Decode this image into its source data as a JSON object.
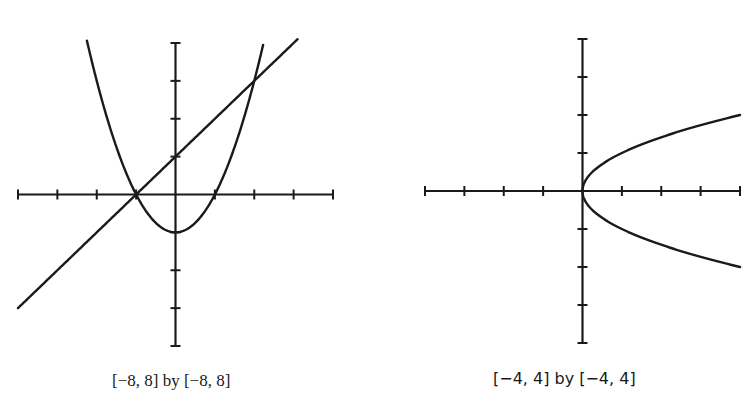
{
  "chart_data": [
    {
      "type": "line",
      "title": "",
      "caption": "[−8, 8] by [−8, 8]",
      "xlim": [
        -8,
        8
      ],
      "ylim": [
        -8,
        8
      ],
      "xlabel": "",
      "ylabel": "",
      "tick_spacing": 2,
      "grid": false,
      "legend": "none",
      "series": [
        {
          "name": "y = x^2/2 - 2 (parabola)",
          "x": [
            -5.3,
            -4,
            -2,
            0,
            2,
            4,
            4.4
          ],
          "y": [
            12,
            6,
            0,
            -2,
            0,
            6,
            7.7
          ]
        },
        {
          "name": "y = x + 2 (line)",
          "x": [
            -8,
            -2,
            0,
            4,
            6.2
          ],
          "y": [
            -6,
            0,
            2,
            6,
            8.2
          ]
        }
      ],
      "intersections": [
        [
          -2,
          0
        ],
        [
          4,
          6
        ]
      ]
    },
    {
      "type": "line",
      "title": "",
      "caption": "[−4, 4] by [−4, 4]",
      "xlim": [
        -4,
        4
      ],
      "ylim": [
        -4,
        4
      ],
      "xlabel": "",
      "ylabel": "",
      "tick_spacing": 1,
      "grid": false,
      "legend": "none",
      "series": [
        {
          "name": "x = y^2 (upper branch)",
          "x": [
            0,
            0.25,
            1,
            2,
            3,
            4
          ],
          "y": [
            0,
            0.5,
            1,
            1.41,
            1.73,
            2
          ]
        },
        {
          "name": "x = y^2 (lower branch)",
          "x": [
            0,
            0.25,
            1,
            2,
            3,
            4
          ],
          "y": [
            0,
            -0.5,
            -1,
            -1.41,
            -1.73,
            -2
          ]
        }
      ]
    }
  ],
  "captions": {
    "left": "[−8, 8] by [−8, 8]",
    "right": "[−4, 4] by [−4, 4]"
  },
  "colors": {
    "ink": "#1a1a1a",
    "background": "#ffffff"
  }
}
